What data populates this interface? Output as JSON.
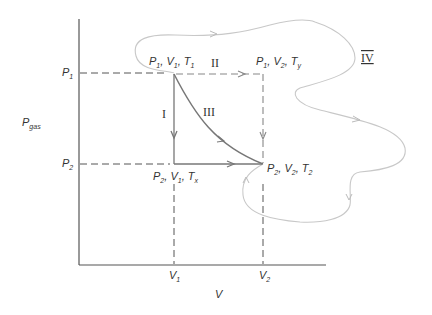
{
  "axes": {
    "y_label": "P",
    "y_label_sub": "gas",
    "x_label": "V",
    "y_ticks": [
      {
        "main": "P",
        "sub": "1"
      },
      {
        "main": "P",
        "sub": "2"
      }
    ],
    "x_ticks": [
      {
        "main": "V",
        "sub": "1"
      },
      {
        "main": "V",
        "sub": "2"
      }
    ]
  },
  "states": {
    "initial": {
      "p": "P",
      "p_sub": "1",
      "v": "V",
      "v_sub": "1",
      "t": "T",
      "t_sub": "1"
    },
    "corner_top": {
      "p": "P",
      "p_sub": "1",
      "v": "V",
      "v_sub": "2",
      "t": "T",
      "t_sub": "y"
    },
    "corner_bottom": {
      "p": "P",
      "p_sub": "2",
      "v": "V",
      "v_sub": "1",
      "t": "T",
      "t_sub": "x"
    },
    "final": {
      "p": "P",
      "p_sub": "2",
      "v": "V",
      "v_sub": "2",
      "t": "T",
      "t_sub": "2"
    }
  },
  "paths": {
    "I": "I",
    "II": "II",
    "III": "III",
    "IV": "IV"
  },
  "colors": {
    "axis": "#555555",
    "path_solid": "#777777",
    "path_dashed": "#888888",
    "path_iv": "#c8c8c8",
    "text": "#333333"
  }
}
